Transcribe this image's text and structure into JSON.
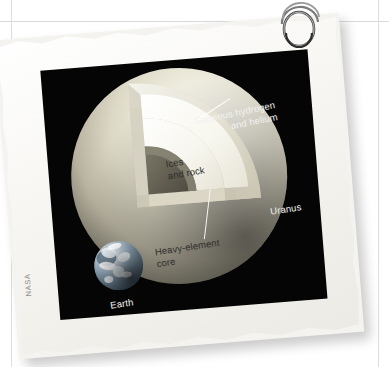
{
  "page": {
    "background_color": "#ffffff",
    "rule_color": "#d9d9d9"
  },
  "photo": {
    "border_color": "#f6f5f1",
    "plate_color": "#050505",
    "credit": "NASA",
    "rotation_deg": -4.6
  },
  "ring": {
    "icon": "binder-ring-icon",
    "color": "#6b6b6b"
  },
  "diagram": {
    "subject_label": "Uranus",
    "scale_object_label": "Earth",
    "labels": {
      "gaseous": "Gaseous hydrogen\nand helium",
      "ices": "Ices\nand rock",
      "core": "Heavy-element\ncore"
    },
    "layers": [
      {
        "name": "gaseous-hydrogen-and-helium",
        "label": "Gaseous hydrogen and helium",
        "color": "#e6e3d4",
        "order": 1
      },
      {
        "name": "ices-and-rock",
        "label": "Ices and rock",
        "color": "#fbfaf4",
        "order": 2
      },
      {
        "name": "heavy-element-core",
        "label": "Heavy-element core",
        "color": "#6e6a5d",
        "order": 3
      }
    ],
    "bodies": [
      {
        "name": "uranus",
        "label": "Uranus",
        "relative_size": 216
      },
      {
        "name": "earth",
        "label": "Earth",
        "relative_size": 49
      }
    ]
  }
}
